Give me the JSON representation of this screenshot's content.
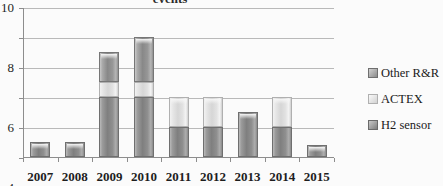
{
  "chart_data": {
    "type": "bar",
    "stacked": true,
    "title": "events",
    "xlabel": "",
    "ylabel": "",
    "ylim": [
      0,
      10
    ],
    "yticks": [
      0,
      2,
      4,
      6,
      8,
      10
    ],
    "ytick_labels": [
      "0",
      "2",
      "4",
      "6",
      "8",
      "10"
    ],
    "grid": true,
    "legend_position": "right",
    "categories": [
      "2007",
      "2008",
      "2009",
      "2010",
      "2011",
      "2012",
      "2013",
      "2014",
      "2015"
    ],
    "series": [
      {
        "name": "H2 sensor",
        "color": "#8f8f8f",
        "values": [
          1,
          1,
          4,
          4,
          2,
          2,
          3,
          2,
          0.8
        ]
      },
      {
        "name": "ACTEX",
        "color": "#e2e2e2",
        "values": [
          0,
          0,
          1,
          1,
          2,
          2,
          0,
          2,
          0
        ]
      },
      {
        "name": "Other R&R",
        "color": "#979797",
        "values": [
          0,
          0,
          2,
          3,
          0,
          0,
          0,
          0,
          0
        ]
      }
    ],
    "totals": [
      1,
      1,
      7,
      8,
      4,
      4,
      3,
      4,
      0.8
    ]
  },
  "legend": {
    "items": [
      {
        "label": "Other R&R",
        "swatch": "swatch-other-rr"
      },
      {
        "label": "ACTEX",
        "swatch": "swatch-actex"
      },
      {
        "label": "H2 sensor",
        "swatch": "swatch-h2-sensor"
      }
    ]
  }
}
